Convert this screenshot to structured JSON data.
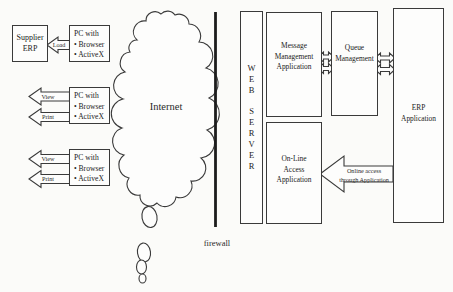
{
  "colors": {
    "ink": "#3a3a3a",
    "text": "#222222",
    "background": "#fbfbf9",
    "firewall_line": "#1c1c1c"
  },
  "left": {
    "supplier_erp_box": {
      "lines": [
        "Supplier",
        "ERP"
      ]
    },
    "load_arrow_label": "Load",
    "view_arrow_label": "View",
    "print_arrow_label": "Print",
    "pc_box": {
      "title": "PC with",
      "items": [
        "• Browser",
        "• ActiveX"
      ]
    }
  },
  "center": {
    "internet_label": "Internet",
    "firewall_label": "firewall"
  },
  "right": {
    "web_server_letters": [
      "W",
      "E",
      "B",
      "S",
      "E",
      "R",
      "V",
      "E",
      "R"
    ],
    "message_management_box": {
      "lines": [
        "Message",
        "Management",
        "Application"
      ]
    },
    "online_access_box": {
      "lines": [
        "On-Line",
        "Access",
        "Application"
      ]
    },
    "queue_management_box": {
      "lines": [
        "Queue",
        "Management"
      ]
    },
    "erp_application_box": {
      "lines": [
        "ERP",
        "Application"
      ]
    },
    "online_access_arrow": {
      "lines": [
        "Online access",
        "through Application"
      ]
    }
  }
}
